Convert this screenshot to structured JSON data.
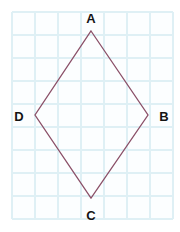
{
  "figure": {
    "type": "geometry-diagram",
    "shape_name": "rhombus ABCD",
    "canvas": {
      "width": 180,
      "height": 232,
      "background": "#ffffff"
    },
    "grid": {
      "visible": true,
      "cell_size": 23,
      "origin_x": 12,
      "origin_y": 12,
      "columns": 7,
      "rows": 9,
      "line_color": "#dff0f5",
      "line_width": 1.4,
      "fill_color": "#fcfeff"
    },
    "outline": {
      "stroke_color": "#8b5068",
      "stroke_width": 1.3,
      "fill": "none",
      "closed": true
    },
    "vertices": [
      {
        "id": "A",
        "label": "A",
        "x": 91,
        "y": 31,
        "label_x": 91,
        "label_y": 18,
        "label_position": "above"
      },
      {
        "id": "B",
        "label": "B",
        "x": 148,
        "y": 115,
        "label_x": 164,
        "label_y": 116,
        "label_position": "right"
      },
      {
        "id": "C",
        "label": "C",
        "x": 91,
        "y": 198,
        "label_x": 91,
        "label_y": 215,
        "label_position": "below"
      },
      {
        "id": "D",
        "label": "D",
        "x": 35,
        "y": 115,
        "label_x": 19,
        "label_y": 116,
        "label_position": "left"
      }
    ],
    "edges": [
      {
        "id": "AB",
        "from": "A",
        "to": "B"
      },
      {
        "id": "BC",
        "from": "B",
        "to": "C"
      },
      {
        "id": "CD",
        "from": "C",
        "to": "D"
      },
      {
        "id": "DA",
        "from": "D",
        "to": "A"
      }
    ],
    "label_style": {
      "color": "#141414",
      "font_size": 13,
      "font_weight": "bold"
    }
  }
}
